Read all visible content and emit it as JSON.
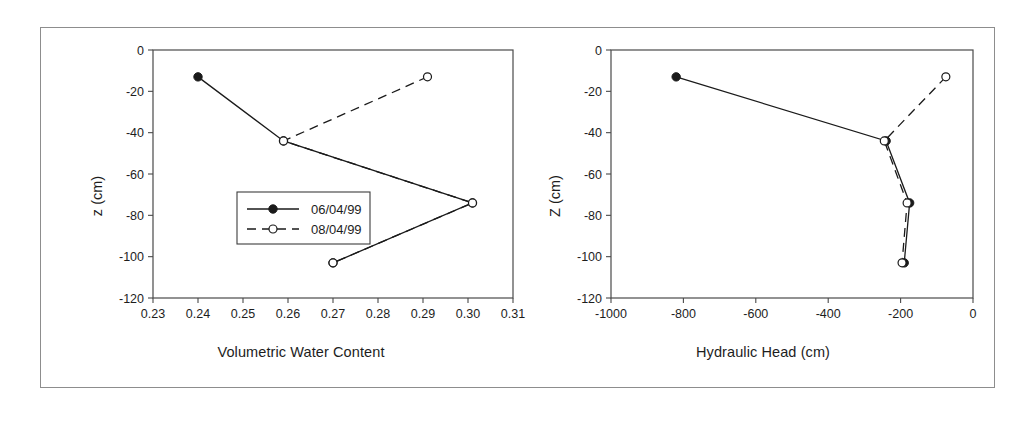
{
  "figure": {
    "panels": [
      {
        "id": "volumetric-water-content",
        "xlabel": "Volumetric Water Content",
        "ylabel": "z (cm)",
        "xticks": [
          "0.23",
          "0.24",
          "0.25",
          "0.26",
          "0.27",
          "0.28",
          "0.29",
          "0.30",
          "0.31"
        ],
        "yticks": [
          "0",
          "-20",
          "-40",
          "-60",
          "-80",
          "-100",
          "-120"
        ],
        "legend": {
          "items": [
            {
              "label": "06/04/99",
              "marker": "filled-circle",
              "line": "solid"
            },
            {
              "label": "08/04/99",
              "marker": "open-circle",
              "line": "dashed"
            }
          ]
        }
      },
      {
        "id": "hydraulic-head",
        "xlabel": "Hydraulic Head (cm)",
        "ylabel": "Z (cm)",
        "xticks": [
          "-1000",
          "-800",
          "-600",
          "-400",
          "-200",
          "0"
        ],
        "yticks": [
          "0",
          "-20",
          "-40",
          "-60",
          "-80",
          "-100",
          "-120"
        ],
        "legend": {
          "items": []
        }
      }
    ]
  },
  "chart_data": [
    {
      "type": "line",
      "id": "volumetric-water-content",
      "title": "",
      "xlabel": "Volumetric Water Content",
      "ylabel": "z (cm)",
      "xlim": [
        0.23,
        0.31
      ],
      "ylim": [
        -120,
        0
      ],
      "xticks": [
        0.23,
        0.24,
        0.25,
        0.26,
        0.27,
        0.28,
        0.29,
        0.3,
        0.31
      ],
      "yticks": [
        0,
        -20,
        -40,
        -60,
        -80,
        -100,
        -120
      ],
      "grid": false,
      "legend_position": "inside-left-middle",
      "orientation": "x-is-value, y-is-depth",
      "series": [
        {
          "name": "06/04/99",
          "marker": "filled-circle",
          "linestyle": "solid",
          "color": "#1a1a1a",
          "x": [
            0.24,
            0.259,
            0.301,
            0.27
          ],
          "y": [
            -13,
            -44,
            -74,
            -103
          ]
        },
        {
          "name": "08/04/99",
          "marker": "open-circle",
          "linestyle": "dashed",
          "color": "#1a1a1a",
          "x": [
            0.291,
            0.259,
            0.301,
            0.27
          ],
          "y": [
            -13,
            -44,
            -74,
            -103
          ]
        }
      ]
    },
    {
      "type": "line",
      "id": "hydraulic-head",
      "title": "",
      "xlabel": "Hydraulic Head (cm)",
      "ylabel": "Z (cm)",
      "xlim": [
        -1000,
        0
      ],
      "ylim": [
        -120,
        0
      ],
      "xticks": [
        -1000,
        -800,
        -600,
        -400,
        -200,
        0
      ],
      "yticks": [
        0,
        -20,
        -40,
        -60,
        -80,
        -100,
        -120
      ],
      "grid": false,
      "legend_position": "none",
      "orientation": "x-is-value, y-is-depth",
      "series": [
        {
          "name": "06/04/99",
          "marker": "filled-circle",
          "linestyle": "solid",
          "color": "#1a1a1a",
          "x": [
            -820,
            -240,
            -175,
            -190
          ],
          "y": [
            -13,
            -44,
            -74,
            -103
          ]
        },
        {
          "name": "08/04/99",
          "marker": "open-circle",
          "linestyle": "dashed",
          "color": "#1a1a1a",
          "x": [
            -75,
            -245,
            -182,
            -196
          ],
          "y": [
            -13,
            -44,
            -74,
            -103
          ]
        }
      ]
    }
  ]
}
